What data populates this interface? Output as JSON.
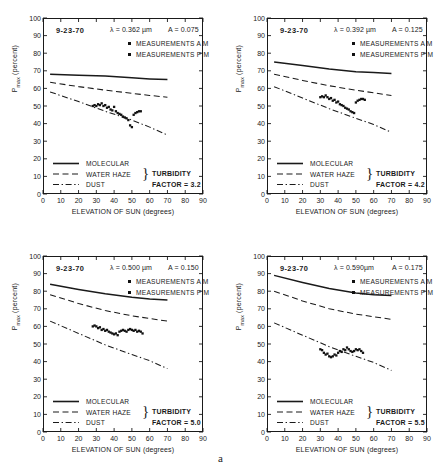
{
  "figure": {
    "label": "a",
    "axis": {
      "xlabel": "ELEVATION OF SUN  (degrees)",
      "ylabel_main": "P",
      "ylabel_sub": "max",
      "ylabel_unit": " (percent)",
      "xticks": [
        0,
        10,
        20,
        30,
        40,
        50,
        60,
        70,
        80,
        90
      ],
      "yticks": [
        0,
        10,
        20,
        30,
        40,
        50,
        60,
        70,
        80,
        90,
        100
      ],
      "xlim": [
        0,
        90
      ],
      "ylim": [
        0,
        100
      ]
    },
    "legend_curves": [
      {
        "label": "MOLECULAR",
        "style": "solid"
      },
      {
        "label": "WATER HAZE",
        "style": "dashed"
      },
      {
        "label": "DUST",
        "style": "dashdot"
      }
    ],
    "measurement_legend": [
      {
        "label": "MEASUREMENTS A M",
        "marker": "square-small"
      },
      {
        "label": "MEASUREMENTS P M",
        "marker": "square-small"
      }
    ],
    "turbidity_label_line1": "TURBIDITY",
    "turbidity_label_line2_prefix": "FACTOR = "
  },
  "chart_data": [
    {
      "type": "scatter",
      "panel": "top-left",
      "date": "9-23-70",
      "lambda_text": "λ = 0.362 µm",
      "lambda_value": 0.362,
      "a_text": "A = 0.075",
      "a_value": 0.075,
      "turbidity_factor": "3.2",
      "xlabel": "ELEVATION OF SUN  (degrees)",
      "ylabel": "Pmax (percent)",
      "xlim": [
        0,
        90
      ],
      "ylim": [
        0,
        100
      ],
      "grid": false,
      "series": [
        {
          "name": "MOLECULAR",
          "style": "solid",
          "x": [
            4,
            20,
            35,
            50,
            60,
            70
          ],
          "values": [
            68,
            67.5,
            67,
            66,
            65.4,
            65
          ]
        },
        {
          "name": "WATER HAZE",
          "style": "dashed",
          "x": [
            4,
            20,
            35,
            50,
            60,
            70
          ],
          "values": [
            63.5,
            61,
            59,
            57.2,
            56,
            55
          ]
        },
        {
          "name": "DUST",
          "style": "dashdot",
          "x": [
            4,
            20,
            35,
            50,
            60,
            70
          ],
          "values": [
            58,
            52.5,
            47,
            42,
            38,
            33.5
          ]
        },
        {
          "name": "MEASUREMENTS A M",
          "style": "points",
          "x": [
            28,
            29,
            30,
            31,
            32,
            33,
            34,
            35,
            36,
            37,
            38,
            39,
            40,
            41,
            42,
            43,
            44,
            45,
            46,
            47,
            48,
            49,
            50,
            51,
            52,
            53,
            54,
            55
          ],
          "values": [
            50,
            50.5,
            50,
            51,
            50.5,
            51.5,
            50,
            50.5,
            49,
            49.5,
            48,
            47.5,
            49.5,
            47,
            46,
            45.5,
            45,
            44,
            43.5,
            43,
            42,
            39,
            38,
            45,
            46,
            46.5,
            47,
            47
          ]
        }
      ]
    },
    {
      "type": "scatter",
      "panel": "top-right",
      "date": "9-23-70",
      "lambda_text": "λ = 0.392 µm",
      "lambda_value": 0.392,
      "a_text": "A = 0.125",
      "a_value": 0.125,
      "turbidity_factor": "4.2",
      "xlabel": "ELEVATION OF SUN  (degrees)",
      "ylabel": "Pmax (percent)",
      "xlim": [
        0,
        90
      ],
      "ylim": [
        0,
        100
      ],
      "grid": false,
      "series": [
        {
          "name": "MOLECULAR",
          "style": "solid",
          "x": [
            4,
            20,
            35,
            50,
            60,
            70
          ],
          "values": [
            75,
            73,
            71,
            69.5,
            69,
            68.5
          ]
        },
        {
          "name": "WATER HAZE",
          "style": "dashed",
          "x": [
            4,
            20,
            35,
            50,
            60,
            70
          ],
          "values": [
            68,
            64.5,
            61.5,
            59,
            57.5,
            56
          ]
        },
        {
          "name": "DUST",
          "style": "dashdot",
          "x": [
            4,
            20,
            35,
            50,
            60,
            70
          ],
          "values": [
            61,
            54.5,
            48.5,
            43,
            39.5,
            35
          ]
        },
        {
          "name": "MEASUREMENTS A M",
          "style": "points",
          "x": [
            30,
            31,
            32,
            33,
            34,
            35,
            36,
            37,
            38,
            39,
            40,
            41,
            42,
            43,
            44,
            45,
            46,
            47,
            48,
            49,
            50,
            51,
            52,
            53,
            54,
            55
          ],
          "values": [
            55,
            55.5,
            55,
            56,
            55,
            54,
            54.5,
            53,
            53.5,
            52,
            52.5,
            51,
            50.5,
            50,
            49,
            48.5,
            48,
            47,
            46.5,
            46,
            52,
            53,
            53.5,
            54,
            54,
            53.5
          ]
        }
      ]
    },
    {
      "type": "scatter",
      "panel": "bottom-left",
      "date": "9-23-70",
      "lambda_text": "λ = 0.500 µm",
      "lambda_value": 0.5,
      "a_text": "A = 0.150",
      "a_value": 0.15,
      "turbidity_factor": "5.0",
      "xlabel": "ELEVATION OF SUN  (degrees)",
      "ylabel": "Pmax (percent)",
      "xlim": [
        0,
        90
      ],
      "ylim": [
        0,
        100
      ],
      "grid": false,
      "series": [
        {
          "name": "MOLECULAR",
          "style": "solid",
          "x": [
            4,
            20,
            35,
            50,
            60,
            70
          ],
          "values": [
            84,
            81,
            78.5,
            76.5,
            75.5,
            75
          ]
        },
        {
          "name": "WATER HAZE",
          "style": "dashed",
          "x": [
            4,
            20,
            35,
            50,
            60,
            70
          ],
          "values": [
            78,
            73,
            69,
            66,
            64.5,
            63
          ]
        },
        {
          "name": "DUST",
          "style": "dashdot",
          "x": [
            4,
            20,
            35,
            50,
            60,
            70
          ],
          "values": [
            63,
            56,
            49.5,
            44,
            40.5,
            36
          ]
        },
        {
          "name": "MEASUREMENTS A M",
          "style": "points",
          "x": [
            28,
            29,
            30,
            31,
            32,
            33,
            34,
            35,
            36,
            37,
            38,
            39,
            40,
            41,
            42,
            43,
            44,
            45,
            46,
            47,
            48,
            49,
            50,
            51,
            52,
            53,
            54,
            55,
            56
          ],
          "values": [
            60,
            60.5,
            60,
            59,
            59.5,
            58,
            58.5,
            57.5,
            58,
            57,
            56.5,
            56,
            55.5,
            56,
            55,
            57,
            57.5,
            58,
            57.5,
            57,
            58,
            58.5,
            58,
            57.5,
            58,
            57,
            57.5,
            57,
            56
          ]
        }
      ]
    },
    {
      "type": "scatter",
      "panel": "bottom-right",
      "date": "9-23-70",
      "lambda_text": "λ = 0.590µm",
      "lambda_value": 0.59,
      "a_text": "A = 0.175",
      "a_value": 0.175,
      "turbidity_factor": "5.5",
      "xlabel": "ELEVATION OF SUN  (degrees)",
      "ylabel": "Pmax (percent)",
      "xlim": [
        0,
        90
      ],
      "ylim": [
        0,
        100
      ],
      "grid": false,
      "series": [
        {
          "name": "MOLECULAR",
          "style": "solid",
          "x": [
            4,
            20,
            35,
            50,
            60,
            70
          ],
          "values": [
            89,
            85,
            81.5,
            79,
            78,
            77.5
          ]
        },
        {
          "name": "WATER HAZE",
          "style": "dashed",
          "x": [
            4,
            20,
            35,
            50,
            60,
            70
          ],
          "values": [
            80,
            74.5,
            70,
            67,
            65.5,
            64
          ]
        },
        {
          "name": "DUST",
          "style": "dashdot",
          "x": [
            4,
            20,
            35,
            50,
            60,
            70
          ],
          "values": [
            62,
            55,
            48.5,
            43,
            39.5,
            35
          ]
        },
        {
          "name": "MEASUREMENTS A M",
          "style": "points",
          "x": [
            30,
            31,
            32,
            33,
            34,
            35,
            36,
            37,
            38,
            39,
            40,
            41,
            42,
            43,
            44,
            45,
            46,
            47,
            48,
            49,
            50,
            51,
            52,
            53,
            54
          ],
          "values": [
            47,
            46.5,
            45,
            44,
            44.5,
            43,
            42.5,
            43,
            44,
            43.5,
            45,
            46,
            45.5,
            47,
            46.5,
            48,
            47,
            46,
            45.5,
            46,
            47,
            46.5,
            47,
            46,
            45
          ]
        }
      ]
    }
  ]
}
